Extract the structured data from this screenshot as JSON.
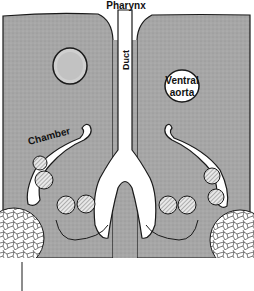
{
  "diagram": {
    "labels": {
      "pharynx": "Pharynx",
      "duct": "Duct",
      "ventral_aorta_line1": "Ventral",
      "ventral_aorta_line2": "aorta",
      "chamber": "Chamber"
    },
    "colors": {
      "tissue": "#a9a9a9",
      "outline": "#1a1a1a",
      "lumen": "#ffffff",
      "vessel_fill": "#c8c8c8"
    }
  }
}
